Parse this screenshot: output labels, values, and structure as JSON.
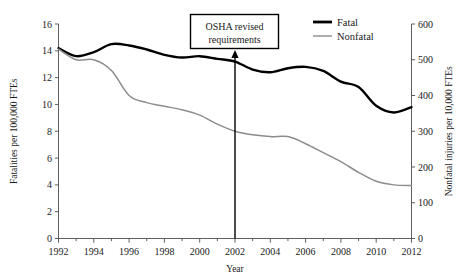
{
  "chart_data": {
    "type": "line",
    "title": "",
    "xlabel": "Year",
    "ylabel": "Fatalities per 100,000 FTEs",
    "y2label": "Nonfatal injuries per 10,000 FTEs",
    "xlim": [
      1992,
      2012
    ],
    "ylim": [
      0,
      16
    ],
    "y2lim": [
      0,
      600
    ],
    "grid": false,
    "legend_position": "top-right",
    "x": [
      1992,
      1993,
      1994,
      1995,
      1996,
      1997,
      1998,
      1999,
      2000,
      2001,
      2002,
      2003,
      2004,
      2005,
      2006,
      2007,
      2008,
      2009,
      2010,
      2011,
      2012
    ],
    "xticks": [
      1992,
      1994,
      1996,
      1998,
      2000,
      2002,
      2004,
      2006,
      2008,
      2010,
      2012
    ],
    "xtick_labels": [
      "1992",
      "1994",
      "1996",
      "1998",
      "2000",
      "2002",
      "2004",
      "2006",
      "2008",
      "2010",
      "2012"
    ],
    "xminor_ticks": [
      1993,
      1995,
      1997,
      1999,
      2001,
      2003,
      2005,
      2007,
      2009,
      2011
    ],
    "yticks": [
      0,
      2,
      4,
      6,
      8,
      10,
      12,
      14,
      16
    ],
    "ytick_labels": [
      "0",
      "2",
      "4",
      "6",
      "8",
      "10",
      "12",
      "14",
      "16"
    ],
    "y2ticks": [
      0,
      100,
      200,
      300,
      400,
      500,
      600
    ],
    "y2tick_labels": [
      "0",
      "100",
      "200",
      "300",
      "400",
      "500",
      "600"
    ],
    "series": [
      {
        "name": "Fatal",
        "axis": "left",
        "color": "#000000",
        "linewidth": 2.4,
        "values": [
          14.2,
          13.6,
          13.9,
          14.5,
          14.4,
          14.1,
          13.7,
          13.5,
          13.6,
          13.4,
          13.2,
          12.6,
          12.4,
          12.7,
          12.8,
          12.5,
          11.7,
          11.3,
          9.9,
          9.4,
          9.8
        ]
      },
      {
        "name": "Nonfatal",
        "axis": "right",
        "color": "#8c8c8c",
        "linewidth": 1.5,
        "values": [
          530,
          500,
          500,
          470,
          400,
          380,
          370,
          360,
          345,
          320,
          300,
          290,
          285,
          285,
          265,
          240,
          215,
          185,
          160,
          150,
          148
        ]
      }
    ],
    "annotations": [
      {
        "name": "osha-annotation",
        "text_lines": [
          "OSHA revised",
          "requirements"
        ],
        "points_to_year": 2002,
        "arrow": true
      }
    ]
  },
  "legend": {
    "items": [
      {
        "label": "Fatal",
        "color": "#000000",
        "linewidth": 2.8
      },
      {
        "label": "Nonfatal",
        "color": "#8c8c8c",
        "linewidth": 1.4
      }
    ]
  }
}
